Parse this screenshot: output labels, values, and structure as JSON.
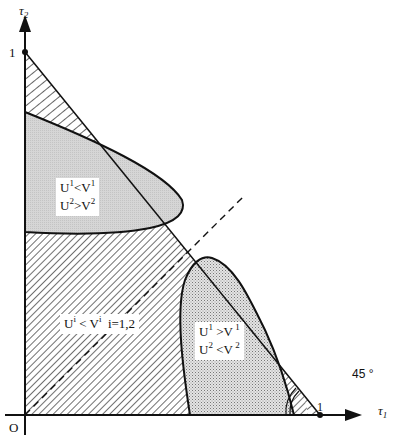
{
  "axes": {
    "x_label": "τ",
    "x_label_sub": "1",
    "y_label": "τ",
    "y_label_sub": "2",
    "origin_label": "O",
    "x_tick": "1",
    "y_tick": "1",
    "angle_label": "45 °"
  },
  "regions": {
    "upper": {
      "line1_U": "U",
      "line1_sup1": "1",
      "line1_op": "<V",
      "line1_sup2": "1",
      "line2_U": "U",
      "line2_sup1": "2",
      "line2_op": ">V",
      "line2_sup2": "2"
    },
    "lower_right": {
      "line1_U": "U",
      "line1_sup1": "1",
      "line1_op": " >V",
      "line1_sup2": " 1",
      "line2_U": "U",
      "line2_sup1": "2",
      "line2_op": " <V",
      "line2_sup2": " 2"
    },
    "main": {
      "U": "U",
      "sup1": "i",
      "op": " < V",
      "sup2": "i",
      "cond": "  i=1,2"
    }
  },
  "colors": {
    "line": "#111111",
    "upper_fill": "#d9d9d9",
    "lower_fill": "#e6e6e6",
    "background": "#ffffff"
  }
}
